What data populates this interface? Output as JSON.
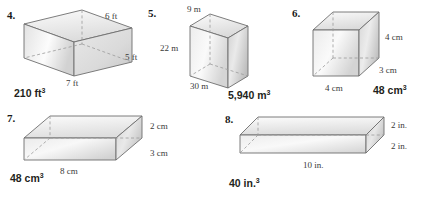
{
  "page": {
    "background": "#ffffff",
    "type": "math-worksheet",
    "topic": "Volume of rectangular prisms",
    "ink_color": "#231f20",
    "figure_stroke": "#6e6e6e",
    "face_light": "#f2f2f2",
    "face_mid": "#d8d8d8",
    "face_dark": "#b9b9b9"
  },
  "problems": [
    {
      "number": "4.",
      "answer_value": "210 ft",
      "answer_exp": "3",
      "unit": "ft",
      "shape": "rectangular-prism",
      "dimensions": [
        {
          "label": "6 ft",
          "value": 6,
          "edge": "depth"
        },
        {
          "label": "5 ft",
          "value": 5,
          "edge": "height"
        },
        {
          "label": "7 ft",
          "value": 7,
          "edge": "width"
        }
      ],
      "volume": 210
    },
    {
      "number": "5.",
      "answer_value": "5,940 m",
      "answer_exp": "3",
      "unit": "m",
      "shape": "rectangular-prism",
      "dimensions": [
        {
          "label": "9 m",
          "value": 9,
          "edge": "depth"
        },
        {
          "label": "22 m",
          "value": 22,
          "edge": "height"
        },
        {
          "label": "30 m",
          "value": 30,
          "edge": "width"
        }
      ],
      "volume": 5940
    },
    {
      "number": "6.",
      "answer_value": "48 cm",
      "answer_exp": "3",
      "unit": "cm",
      "shape": "rectangular-prism",
      "dimensions": [
        {
          "label": "4 cm",
          "value": 4,
          "edge": "height"
        },
        {
          "label": "3 cm",
          "value": 3,
          "edge": "depth"
        },
        {
          "label": "4 cm",
          "value": 4,
          "edge": "width"
        }
      ],
      "volume": 48
    },
    {
      "number": "7.",
      "answer_value": "48 cm",
      "answer_exp": "3",
      "unit": "cm",
      "shape": "rectangular-prism",
      "dimensions": [
        {
          "label": "2 cm",
          "value": 2,
          "edge": "height"
        },
        {
          "label": "3 cm",
          "value": 3,
          "edge": "depth"
        },
        {
          "label": "8 cm",
          "value": 8,
          "edge": "width"
        }
      ],
      "volume": 48
    },
    {
      "number": "8.",
      "answer_value": "40 in.",
      "answer_exp": "3",
      "unit": "in.",
      "shape": "rectangular-prism",
      "dimensions": [
        {
          "label": "2 in.",
          "value": 2,
          "edge": "height"
        },
        {
          "label": "2 in.",
          "value": 2,
          "edge": "depth"
        },
        {
          "label": "10 in.",
          "value": 10,
          "edge": "width"
        }
      ],
      "volume": 40
    }
  ]
}
